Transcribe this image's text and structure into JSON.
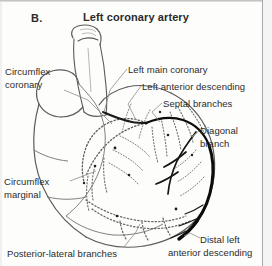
{
  "figure": {
    "panel_label": "B.",
    "title": "Left coronary artery",
    "type": "anatomical-illustration",
    "view": "posterior-lateral angiographic projection"
  },
  "labels": {
    "circumflex_coronary_line1": "Circumflex",
    "circumflex_coronary_line2": "coronary",
    "circumflex_marginal_line1": "Circumflex",
    "circumflex_marginal_line2": "marginal",
    "posterior_lateral_branches": "Posterior-lateral branches",
    "left_main_coronary": "Left main coronary",
    "left_anterior_descending": "Left anterior descending",
    "septal_branches": "Septal branches",
    "diagonal_branch_line1": "Diagonal",
    "diagonal_branch_line2": "branch",
    "distal_lad_line1": "Distal left",
    "distal_lad_line2": "anterior descending"
  },
  "colors": {
    "ink": "#2b2b2b",
    "outline": "#555555",
    "vessel_dashed": "#6a6a6a",
    "vessel_solid": "#111111",
    "leader": "#8a8a8a",
    "background": "#fdfdfc",
    "scan_border": "#a9a9a9"
  }
}
